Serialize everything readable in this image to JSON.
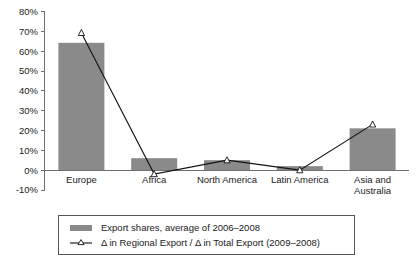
{
  "chart_data": {
    "type": "bar",
    "title": "",
    "subtitle": "",
    "xlabel": "",
    "ylabel": "",
    "ylim": [
      -10,
      80
    ],
    "ytick_labels": [
      "80%",
      "70%",
      "60%",
      "50%",
      "40%",
      "30%",
      "20%",
      "10%",
      "0%",
      "-10%"
    ],
    "ytick_values": [
      80,
      70,
      60,
      50,
      40,
      30,
      20,
      10,
      0,
      -10
    ],
    "grid": false,
    "legend_position": "bottom",
    "categories": [
      "Europe",
      "Africa",
      "North America",
      "Latin America",
      "Asia and Australia"
    ],
    "category_label_lines": [
      [
        "Europe"
      ],
      [
        "Africa"
      ],
      [
        "North America"
      ],
      [
        "Latin America"
      ],
      [
        "Asia and",
        "Australia"
      ]
    ],
    "series": [
      {
        "name": "Export shares, average of 2006–2008",
        "type": "bar",
        "color": "#8a8a8a",
        "values": [
          64,
          6,
          5,
          2,
          21
        ]
      },
      {
        "name": "Δ in Regional Export / Δ in Total Export (2009–2008)",
        "type": "line",
        "color": "#111111",
        "marker": "open-triangle",
        "values": [
          69,
          -2,
          5,
          0,
          23
        ]
      }
    ]
  },
  "legend": {
    "items": [
      {
        "label": "Export shares, average of 2006–2008",
        "marker": "filled-swatch"
      },
      {
        "label": "Δ in Regional Export / Δ in Total Export (2009–2008)",
        "marker": "line-with-triangle"
      }
    ]
  },
  "colors": {
    "bar_fill": "#8a8a8a",
    "line_stroke": "#111111",
    "axis": "#6e6e6e",
    "legend_border": "#555555",
    "background": "#ffffff"
  }
}
